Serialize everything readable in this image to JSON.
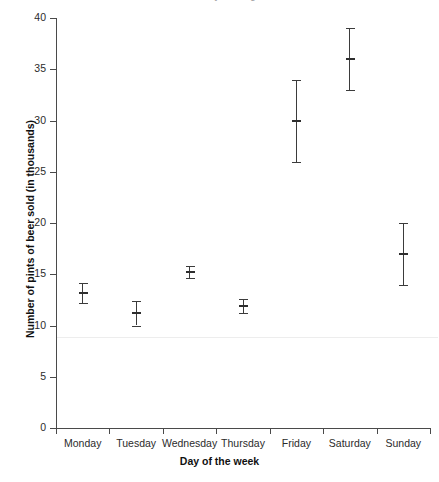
{
  "chart_data": {
    "type": "scatter",
    "title": "Weekday Drinking",
    "xlabel": "Day of the week",
    "ylabel": "Number of pints of beer sold (in thousands)",
    "categories": [
      "Monday",
      "Tuesday",
      "Wednesday",
      "Thursday",
      "Friday",
      "Saturday",
      "Sunday"
    ],
    "values": [
      13.2,
      11.2,
      15.2,
      11.9,
      30.0,
      36.0,
      17.0
    ],
    "errors_low": [
      12.2,
      10.0,
      14.6,
      11.2,
      26.0,
      33.0,
      14.0
    ],
    "errors_high": [
      14.1,
      12.4,
      15.8,
      12.6,
      34.0,
      39.0,
      20.0
    ],
    "ylim": [
      0,
      40
    ],
    "ytick_labels": [
      "0",
      "5",
      "10",
      "15",
      "20",
      "25",
      "30",
      "35",
      "40"
    ],
    "ytick_values": [
      0,
      5,
      10,
      15,
      20,
      25,
      30,
      35,
      40
    ],
    "grid": false,
    "legend": "none",
    "annotations": [
      {
        "name": "reference-line",
        "type": "hline",
        "value": 8.9,
        "color": "#ededed"
      }
    ],
    "series": [
      {
        "name": "Pints sold",
        "marker": "errorbar-with-mean",
        "color": "#3b3b3b"
      }
    ]
  },
  "axis_colors": {
    "spine": "#4a4a4a",
    "tick_text": "#2b2b2b",
    "axis_title": "#111111",
    "marker": "#3b3b3b",
    "reference": "#ededed",
    "title_text": "#9d9d9d"
  }
}
